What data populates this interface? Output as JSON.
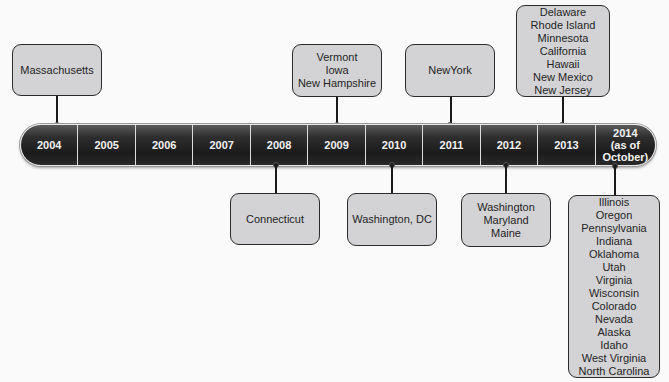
{
  "timeline": {
    "years": [
      {
        "label": "2004",
        "states": [
          "Massachusetts"
        ],
        "position": "above"
      },
      {
        "label": "2005",
        "states": [],
        "position": null
      },
      {
        "label": "2006",
        "states": [],
        "position": null
      },
      {
        "label": "2007",
        "states": [],
        "position": null
      },
      {
        "label": "2008",
        "states": [
          "Connecticut"
        ],
        "position": "below"
      },
      {
        "label": "2009",
        "states": [
          "Vermont",
          "Iowa",
          "New Hampshire"
        ],
        "position": "above"
      },
      {
        "label": "2010",
        "states": [
          "Washington, DC"
        ],
        "position": "below"
      },
      {
        "label": "2011",
        "states": [
          "NewYork"
        ],
        "position": "above"
      },
      {
        "label": "2012",
        "states": [
          "Washington",
          "Maryland",
          "Maine"
        ],
        "position": "below"
      },
      {
        "label": "2013",
        "states": [
          "Delaware",
          "Rhode Island",
          "Minnesota",
          "California",
          "Hawaii",
          "New Mexico",
          "New Jersey"
        ],
        "position": "above"
      },
      {
        "label": "2014 (as of October)",
        "label_lines": [
          "2014",
          "(as of",
          "October)"
        ],
        "states": [
          "Illinois",
          "Oregon",
          "Pennsylvania",
          "Indiana",
          "Oklahoma",
          "Utah",
          "Virginia",
          "Wisconsin",
          "Colorado",
          "Nevada",
          "Alaska",
          "Idaho",
          "West Virginia",
          "North Carolina"
        ],
        "position": "below"
      }
    ]
  },
  "colors": {
    "box_fill": "#d3d3d5",
    "box_border": "#2b2b2b",
    "bar_fill": "#1f1f1f",
    "bar_text": "#f2f2f2",
    "divider": "#dcdcdc"
  }
}
